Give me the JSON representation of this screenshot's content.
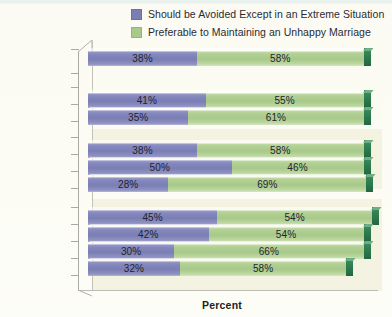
{
  "legend": {
    "position": "top",
    "items": [
      {
        "label": "Should be Avoided Except in an Extreme Situation",
        "color": "#7a7eb4",
        "icon": "legend-swatch-icon"
      },
      {
        "label": "Preferable to Maintaining an Unhappy Marriage",
        "color": "#a8c98a",
        "icon": "legend-swatch-icon"
      }
    ]
  },
  "axis": {
    "xlabel": "Percent"
  },
  "chart_data": {
    "type": "bar",
    "orientation": "horizontal",
    "stacked": true,
    "title": "",
    "subtitle": "",
    "xlabel": "Percent",
    "ylabel": "",
    "xlim": [
      0,
      100
    ],
    "grid": false,
    "legend_position": "top",
    "categories": [
      "All Adults",
      "Men",
      "Women",
      "White",
      "Black",
      "Hispanic",
      "18–29",
      "30–49",
      "50–64",
      "65+"
    ],
    "groups": [
      {
        "name": "total",
        "categories": [
          "All Adults"
        ]
      },
      {
        "name": "gender",
        "categories": [
          "Men",
          "Women"
        ]
      },
      {
        "name": "race",
        "categories": [
          "White",
          "Black",
          "Hispanic"
        ]
      },
      {
        "name": "age",
        "categories": [
          "18–29",
          "30–49",
          "50–64",
          "65+"
        ]
      }
    ],
    "series": [
      {
        "name": "Should be Avoided Except in an Extreme Situation",
        "color": "#7a7eb4",
        "values": [
          38,
          41,
          35,
          38,
          50,
          28,
          45,
          42,
          30,
          32
        ],
        "labels": [
          "38%",
          "41%",
          "35%",
          "38%",
          "50%",
          "28%",
          "45%",
          "42%",
          "30%",
          "32%"
        ]
      },
      {
        "name": "Preferable to Maintaining an Unhappy Marriage",
        "color": "#a8c98a",
        "values": [
          58,
          55,
          61,
          58,
          46,
          69,
          54,
          54,
          66,
          58
        ],
        "labels": [
          "58%",
          "55%",
          "61%",
          "58%",
          "46%",
          "69%",
          "54%",
          "54%",
          "66%",
          "58%"
        ]
      }
    ],
    "rows": [
      {
        "category": "All Adults",
        "blue": 38,
        "green": 58,
        "blue_label": "38%",
        "green_label": "58%"
      },
      {
        "category": "Men",
        "blue": 41,
        "green": 55,
        "blue_label": "41%",
        "green_label": "55%"
      },
      {
        "category": "Women",
        "blue": 35,
        "green": 61,
        "blue_label": "35%",
        "green_label": "61%"
      },
      {
        "category": "White",
        "blue": 38,
        "green": 58,
        "blue_label": "38%",
        "green_label": "58%"
      },
      {
        "category": "Black",
        "blue": 50,
        "green": 46,
        "blue_label": "50%",
        "green_label": "46%"
      },
      {
        "category": "Hispanic",
        "blue": 28,
        "green": 69,
        "blue_label": "28%",
        "green_label": "69%"
      },
      {
        "category": "18–29",
        "blue": 45,
        "green": 54,
        "blue_label": "45%",
        "green_label": "54%"
      },
      {
        "category": "30–49",
        "blue": 42,
        "green": 54,
        "blue_label": "42%",
        "green_label": "54%"
      },
      {
        "category": "50–64",
        "blue": 30,
        "green": 66,
        "blue_label": "30%",
        "green_label": "66%"
      },
      {
        "category": "65+",
        "blue": 32,
        "green": 58,
        "blue_label": "32%",
        "green_label": "58%"
      }
    ]
  },
  "colors": {
    "series_blue": "#7a7eb4",
    "series_green": "#a8c98a",
    "end_cap": "#2e7d4f",
    "background": "#fdfdf6",
    "zone_tint": "#f4f3e2"
  }
}
